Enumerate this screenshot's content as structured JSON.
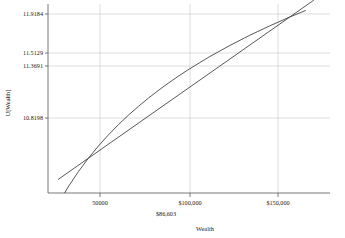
{
  "chart_data": {
    "type": "line",
    "title": "",
    "xlabel": "Wealth",
    "ylabel": "U[Wealth]",
    "grid": true,
    "legend": "none",
    "xlim": [
      30000,
      170000
    ],
    "ylim": [
      10.55,
      12.02
    ],
    "xticks": [
      {
        "value": 50000,
        "label": "50000"
      },
      {
        "value": 100000,
        "label": "$100,000"
      },
      {
        "value": 150000,
        "label": "$150,000"
      }
    ],
    "yticks": [
      {
        "value": 11.9184,
        "label": "11.9184"
      },
      {
        "value": 11.5129,
        "label": "11.5129"
      },
      {
        "value": 11.3691,
        "label": "11.3691"
      },
      {
        "value": 10.8198,
        "label": "10.8198"
      }
    ],
    "annotations": [
      {
        "name": "certainty-equivalent",
        "label": "$86,603",
        "x": 86603
      }
    ],
    "series": [
      {
        "name": "utility-curve",
        "kind": "concave-log-utility",
        "x": [
          36000,
          40000,
          45000,
          50000,
          55000,
          60000,
          65000,
          70000,
          75000,
          80000,
          86603,
          90000,
          95000,
          100000,
          110000,
          120000,
          130000,
          140000,
          150000,
          158000
        ],
        "y": [
          10.4913,
          10.5966,
          10.7144,
          10.8198,
          10.9151,
          11.0021,
          11.0821,
          11.1563,
          11.2252,
          11.2898,
          11.3691,
          11.4076,
          11.4616,
          11.5129,
          11.6082,
          11.6952,
          11.7753,
          11.8494,
          11.9184,
          11.9703
        ]
      },
      {
        "name": "chord-line",
        "kind": "straight-chord",
        "x": [
          35000,
          50000,
          86603,
          100000,
          150000,
          162000
        ],
        "y": [
          10.6549,
          10.8198,
          11.2221,
          11.3691,
          11.9184,
          12.0504
        ]
      }
    ]
  },
  "axis": {
    "y_title": "U[Wealth]",
    "x_title": "Wealth"
  }
}
